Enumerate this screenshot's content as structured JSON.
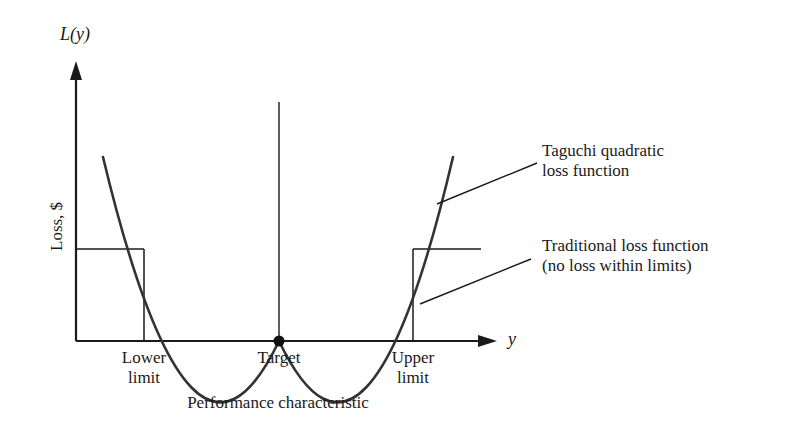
{
  "axes": {
    "y_axis_label": "L(y)",
    "y_axis_title": "Loss, $",
    "x_axis_label": "y",
    "x_axis_title": "Performance characteristic"
  },
  "x_ticks": {
    "lower_limit": [
      "Lower",
      "limit"
    ],
    "target": "Target",
    "upper_limit": [
      "Upper",
      "limit"
    ]
  },
  "annotations": {
    "taguchi": [
      "Taguchi quadratic",
      "loss function"
    ],
    "traditional": [
      "Traditional loss function",
      "(no loss within limits)"
    ]
  },
  "colors": {
    "ink": "#1a1a1a",
    "curve": "#333333",
    "background": "#ffffff"
  }
}
